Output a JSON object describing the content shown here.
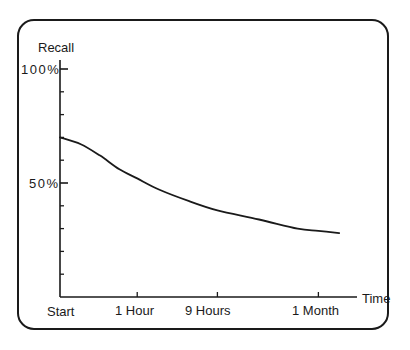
{
  "chart_data": {
    "type": "line",
    "title": "",
    "xlabel": "Time",
    "ylabel": "Recall",
    "ylim": [
      0,
      100
    ],
    "y_ticks": [
      {
        "value": 100,
        "label": "100%"
      },
      {
        "value": 50,
        "label": "50%"
      }
    ],
    "y_minor_tick_step": 10,
    "x_ticks": [
      {
        "position": 0,
        "label": "Start"
      },
      {
        "position": 0.26,
        "label": "1 Hour"
      },
      {
        "position": 0.53,
        "label": "9 Hours"
      },
      {
        "position": 0.87,
        "label": "1 Month"
      }
    ],
    "grid": false,
    "legend": null,
    "series": [
      {
        "name": "Recall",
        "x": [
          0,
          0.07,
          0.135,
          0.2,
          0.26,
          0.335,
          0.435,
          0.53,
          0.67,
          0.8,
          0.87,
          0.94
        ],
        "values": [
          70,
          67,
          62,
          56,
          52,
          47,
          42,
          38,
          34,
          30,
          29,
          28
        ]
      }
    ]
  },
  "labels": {
    "y_axis_title": "Recall",
    "y_tick_100": "100%",
    "y_tick_50": "50%",
    "x_axis_title": "Time",
    "x_tick_start": "Start",
    "x_tick_1hour": "1 Hour",
    "x_tick_9hours": "9 Hours",
    "x_tick_1month": "1 Month"
  },
  "colors": {
    "ink": "#1a1a1a",
    "background": "#ffffff"
  }
}
